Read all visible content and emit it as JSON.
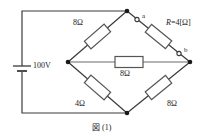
{
  "figure": {
    "caption": "図 (1)",
    "source_label": "100V",
    "terminals": [
      {
        "name": "a",
        "label": "a"
      },
      {
        "name": "b",
        "label": "b"
      }
    ],
    "resistors": [
      {
        "name": "top-left",
        "label": "8Ω"
      },
      {
        "name": "bottom-left",
        "label": "4Ω"
      },
      {
        "name": "bridge",
        "label": "8Ω"
      },
      {
        "name": "bottom-right",
        "label": "8Ω"
      }
    ],
    "variable_resistor": {
      "name": "R",
      "symbol": "R",
      "label_rest": "=4[Ω]"
    },
    "colors": {
      "wire": "#3a3a3a",
      "resistor_outline": "#555555",
      "resistor_fill": "#ffffff",
      "node": "#1a1a1a",
      "text": "#1a1a1a"
    }
  }
}
